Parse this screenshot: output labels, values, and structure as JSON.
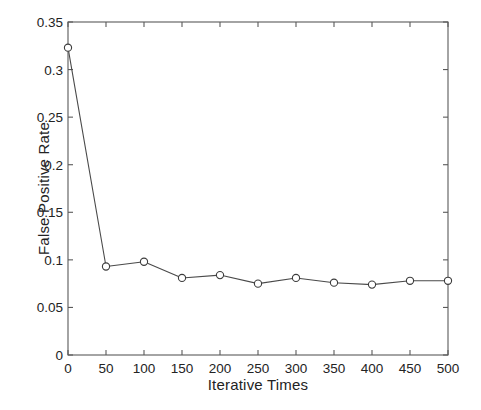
{
  "chart_data": {
    "type": "line",
    "title": "",
    "xlabel": "Iterative Times",
    "ylabel": "False Positive Rate",
    "xlim": [
      0,
      500
    ],
    "ylim": [
      0,
      0.35
    ],
    "xticks": [
      0,
      50,
      100,
      150,
      200,
      250,
      300,
      350,
      400,
      450,
      500
    ],
    "xtick_labels": [
      "0",
      "50",
      "100",
      "150",
      "200",
      "250",
      "300",
      "350",
      "400",
      "450",
      "500"
    ],
    "yticks": [
      0,
      0.05,
      0.1,
      0.15,
      0.2,
      0.25,
      0.3,
      0.35
    ],
    "ytick_labels": [
      "0",
      "0.05",
      "0.1",
      "0.15",
      "0.2",
      "0.25",
      "0.3",
      "0.35"
    ],
    "grid": false,
    "legend": false,
    "marker": "open-circle",
    "line_color": "#4a4a4a",
    "marker_edge_color": "#3c3c3c",
    "marker_face_color": "#ffffff",
    "x": [
      0,
      50,
      100,
      150,
      200,
      250,
      300,
      350,
      400,
      450,
      500
    ],
    "values": [
      0.323,
      0.093,
      0.098,
      0.081,
      0.084,
      0.075,
      0.081,
      0.076,
      0.074,
      0.078,
      0.078
    ],
    "series": [
      {
        "name": "False Positive Rate",
        "x": [
          0,
          50,
          100,
          150,
          200,
          250,
          300,
          350,
          400,
          450,
          500
        ],
        "values": [
          0.323,
          0.093,
          0.098,
          0.081,
          0.084,
          0.075,
          0.081,
          0.076,
          0.074,
          0.078,
          0.078
        ]
      }
    ]
  },
  "caption": {
    "sliver_text": ""
  }
}
